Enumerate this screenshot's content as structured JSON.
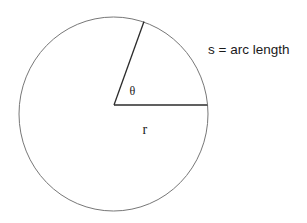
{
  "diagram": {
    "type": "circle-sector",
    "circle": {
      "cx": 113.5,
      "cy": 114,
      "rx": 94.5,
      "ry": 97,
      "stroke": "#777777"
    },
    "radius_lines": {
      "stroke": "#2b2b2b",
      "center": {
        "x": 114,
        "y": 105
      },
      "horizontal_end": {
        "x": 207.5,
        "y": 105
      },
      "angled_end": {
        "x": 144,
        "y": 21.5
      }
    },
    "labels": {
      "arc_length": "s = arc length",
      "angle": "θ",
      "radius": "r"
    }
  }
}
